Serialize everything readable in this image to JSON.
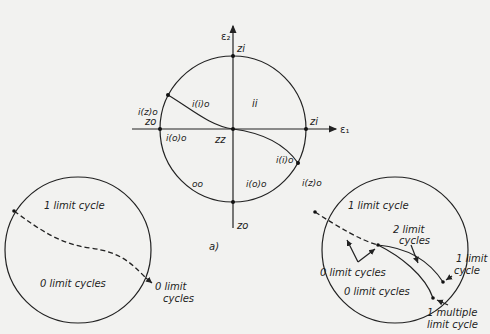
{
  "main_diagram": {
    "axis_x_label": "ε₁",
    "axis_y_label": "ε₂",
    "caption": "a)",
    "points": {
      "top": "zi",
      "right": "zi",
      "left": "zo",
      "bottom": "zo",
      "origin": "zz",
      "upper_left": "i(z)o",
      "lower_right": "i(z)o"
    },
    "regions": {
      "upper_left_inner": "i(i)o",
      "upper_right": "ii",
      "left_sliver": "i(o)o",
      "lower_left": "oo",
      "lower_right": "i(o)o",
      "right_sliver": "i(i)o"
    }
  },
  "left_diagram": {
    "upper_region": "1 limit cycle",
    "lower_region": "0 limit cycles",
    "boundary_callout_line1": "0 limit",
    "boundary_callout_line2": "cycles"
  },
  "right_diagram": {
    "upper_region": "1 limit cycle",
    "middle_region_callout_line1": "2 limit",
    "middle_region_callout_line2": "cycles",
    "dashed_region_label": "0 limit cycles",
    "lower_region": "0 limit cycles",
    "right_callout_line1": "1 limit",
    "right_callout_line2": "cycle",
    "bottom_callout_line1": "1 multiple",
    "bottom_callout_line2": "limit cycle"
  }
}
